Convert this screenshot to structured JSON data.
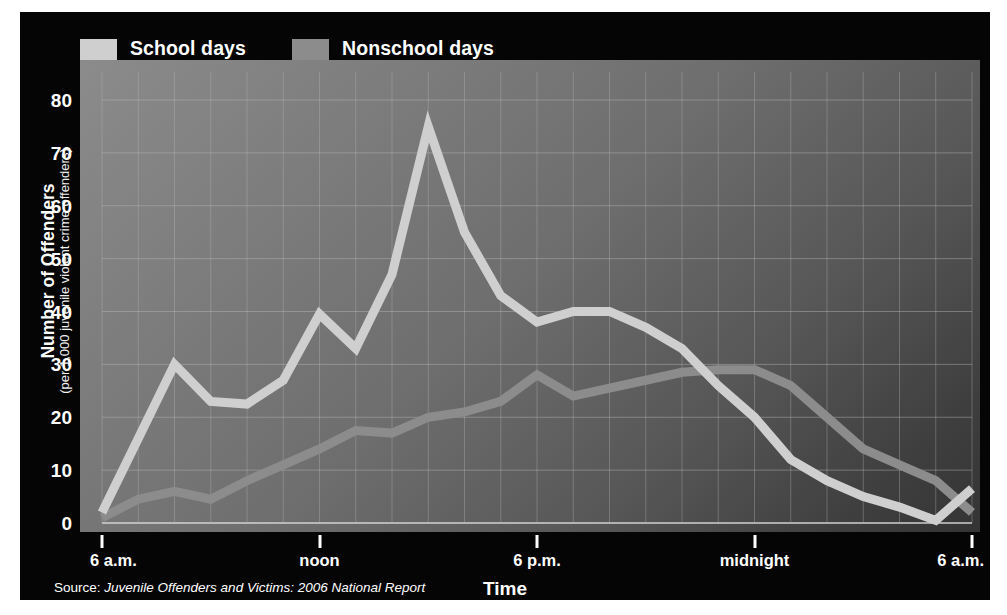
{
  "legend": {
    "items": [
      {
        "label": "School days",
        "color": "#cfcfcf",
        "key": "school"
      },
      {
        "label": "Nonschool days",
        "color": "#8c8c8c",
        "key": "nonschool"
      }
    ]
  },
  "axis": {
    "y_title": "Number of Offenders",
    "y_subtitle": "(per 1,000 juvenile violent crime offenders)",
    "x_title": "Time",
    "y_ticks": [
      "0",
      "10",
      "20",
      "30",
      "40",
      "50",
      "60",
      "70",
      "80"
    ],
    "x_ticks": [
      "6 a.m.",
      "noon",
      "6 p.m.",
      "midnight",
      "6 a.m."
    ]
  },
  "source": {
    "label": "Source:",
    "title": "Juvenile Offenders and Victims: 2006 National Report"
  },
  "chart_data": {
    "type": "line",
    "title": "",
    "xlabel": "Time",
    "ylabel": "Number of Offenders",
    "ylabel_sub": "(per 1,000 juvenile violent crime offenders)",
    "ylim": [
      0,
      80
    ],
    "ytick_step": 10,
    "grid": true,
    "legend_position": "top-left",
    "x": [
      "6 a.m.",
      "7 a.m.",
      "8 a.m.",
      "9 a.m.",
      "10 a.m.",
      "11 a.m.",
      "noon",
      "1 p.m.",
      "2 p.m.",
      "3 p.m.",
      "4 p.m.",
      "5 p.m.",
      "6 p.m.",
      "7 p.m.",
      "8 p.m.",
      "9 p.m.",
      "10 p.m.",
      "11 p.m.",
      "midnight",
      "1 a.m.",
      "2 a.m.",
      "3 a.m.",
      "4 a.m.",
      "5 a.m.",
      "6 a.m."
    ],
    "x_tick_labels": [
      "6 a.m.",
      "noon",
      "6 p.m.",
      "midnight",
      "6 a.m."
    ],
    "x_tick_indices": [
      0,
      6,
      12,
      18,
      24
    ],
    "series": [
      {
        "name": "School days",
        "color": "#cfcfcf",
        "values": [
          2,
          16,
          30,
          23,
          22.5,
          27,
          39.5,
          33,
          47,
          75,
          55,
          43,
          38,
          40,
          40,
          37,
          33,
          26,
          20,
          12,
          8,
          5,
          3,
          0.5,
          6.5
        ]
      },
      {
        "name": "Nonschool days",
        "color": "#8c8c8c",
        "values": [
          1,
          4.5,
          6,
          4.5,
          8,
          11,
          14,
          17.5,
          17,
          20,
          21,
          23,
          28,
          24,
          25.5,
          27,
          28.5,
          29,
          29,
          26,
          20,
          14,
          11,
          8,
          2
        ]
      }
    ]
  }
}
